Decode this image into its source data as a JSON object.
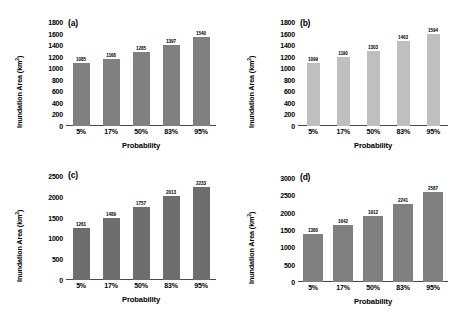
{
  "chart_data": [
    {
      "type": "bar",
      "panel": "(a)",
      "title": "",
      "xlabel": "Probability",
      "ylabel": "Inundation Area (km2)",
      "categories": [
        "5%",
        "17%",
        "50%",
        "83%",
        "95%"
      ],
      "values": [
        1085,
        1168,
        1285,
        1397,
        1540
      ],
      "yticks": [
        0,
        200,
        400,
        600,
        800,
        1000,
        1200,
        1400,
        1600,
        1800
      ],
      "ylim": [
        0,
        1800
      ],
      "grid": false,
      "legend": "none",
      "bar_color": "#808080"
    },
    {
      "type": "bar",
      "panel": "(b)",
      "title": "",
      "xlabel": "Probability",
      "ylabel": "Inundation Area (km2)",
      "categories": [
        "5%",
        "17%",
        "50%",
        "83%",
        "95%"
      ],
      "values": [
        1099,
        1190,
        1303,
        1463,
        1594
      ],
      "yticks": [
        0,
        200,
        400,
        600,
        800,
        1000,
        1200,
        1400,
        1600,
        1800
      ],
      "ylim": [
        0,
        1800
      ],
      "grid": false,
      "legend": "none",
      "bar_color": "#bfbfbf"
    },
    {
      "type": "bar",
      "panel": "(c)",
      "title": "",
      "xlabel": "Probability",
      "ylabel": "Inundation Area (km2)",
      "categories": [
        "5%",
        "17%",
        "50%",
        "83%",
        "95%"
      ],
      "values": [
        1261,
        1489,
        1757,
        2013,
        2233
      ],
      "yticks": [
        0,
        500,
        1000,
        1500,
        2000,
        2500
      ],
      "ylim": [
        0,
        2500
      ],
      "grid": false,
      "legend": "none",
      "bar_color": "#6e6e6e"
    },
    {
      "type": "bar",
      "panel": "(d)",
      "title": "",
      "xlabel": "Probability",
      "ylabel": "Inundation Area (km2)",
      "categories": [
        "5%",
        "17%",
        "50%",
        "83%",
        "95%"
      ],
      "values": [
        1380,
        1642,
        1912,
        2241,
        2587
      ],
      "yticks": [
        0,
        500,
        1000,
        1500,
        2000,
        2500,
        3000
      ],
      "ylim": [
        0,
        3000
      ],
      "grid": false,
      "legend": "none",
      "bar_color": "#808080"
    }
  ],
  "panels": [
    {
      "label": "(a)",
      "ylabel_main": "Inundation Area (km",
      "ylabel_sup": "2",
      "ylabel_end": ")",
      "xtitle": "Probability"
    },
    {
      "label": "(b)",
      "ylabel_main": "Inundation Area (km",
      "ylabel_sup": "2",
      "ylabel_end": ")",
      "xtitle": "Probability"
    },
    {
      "label": "(c)",
      "ylabel_main": "Inundation Area (km",
      "ylabel_sup": "2",
      "ylabel_end": ")",
      "xtitle": "Probability"
    },
    {
      "label": "(d)",
      "ylabel_main": "Inundation Area (km",
      "ylabel_sup": "2",
      "ylabel_end": ")",
      "xtitle": "Probability"
    }
  ]
}
